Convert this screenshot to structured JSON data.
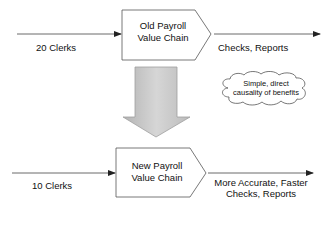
{
  "diagram": {
    "old_chain": {
      "label_line1": "Old Payroll",
      "label_line2": "Value Chain",
      "input_label": "20 Clerks",
      "output_label": "Checks, Reports"
    },
    "new_chain": {
      "label_line1": "New Payroll",
      "label_line2": "Value Chain",
      "input_label": "10 Clerks",
      "output_label_line1": "More Accurate, Faster",
      "output_label_line2": "Checks, Reports"
    },
    "callout": {
      "line1": "Simple, direct",
      "line2": "causality of benefits"
    },
    "colors": {
      "line": "#333333",
      "arrow_fill": "#c8c8c8",
      "arrow_stroke": "#9a9a9a",
      "background": "#ffffff"
    }
  }
}
